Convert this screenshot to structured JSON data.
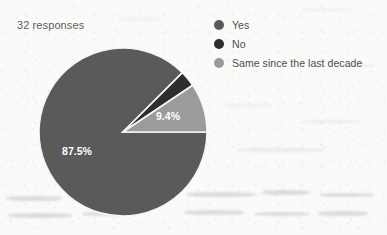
{
  "header": {
    "responses_label": "32 responses"
  },
  "legend": {
    "position": "top-right",
    "items": [
      {
        "label": "Yes",
        "color": "#5a5a5a",
        "icon": "legend-dot-icon"
      },
      {
        "label": "No",
        "color": "#2e2e2e",
        "icon": "legend-dot-icon"
      },
      {
        "label": "Same since the last decade",
        "color": "#9b9b9b",
        "icon": "legend-dot-icon"
      }
    ]
  },
  "chart_data": {
    "type": "pie",
    "title": "",
    "subtitle": "32 responses",
    "total_responses": 32,
    "categories": [
      "Yes",
      "No",
      "Same since the last decade"
    ],
    "values": [
      87.5,
      3.1,
      9.4
    ],
    "counts": [
      28,
      1,
      3
    ],
    "value_unit": "percent",
    "data_labels": [
      "87.5%",
      "",
      "9.4%"
    ],
    "colors": [
      "#5a5a5a",
      "#2e2e2e",
      "#9b9b9b"
    ],
    "legend": "top-right",
    "grid": false,
    "slice_separator_color": "#f5f5f5",
    "label_color": "#ffffff"
  },
  "labels": {
    "yes_percent": "87.5%",
    "same_percent": "9.4%"
  }
}
